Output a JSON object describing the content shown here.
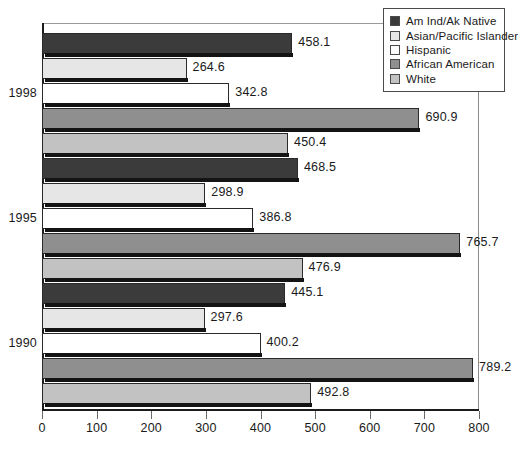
{
  "chart_data": {
    "type": "bar",
    "orientation": "horizontal",
    "title": "",
    "xlabel": "",
    "ylabel": "",
    "xlim": [
      0,
      800
    ],
    "xticks": [
      0,
      100,
      200,
      300,
      400,
      500,
      600,
      700,
      800
    ],
    "xtick_labels": [
      "0",
      "100",
      "200",
      "300",
      "400",
      "500",
      "600",
      "700",
      "800"
    ],
    "grid": false,
    "legend_position": "top-right",
    "categories": [
      "1998",
      "1995",
      "1990"
    ],
    "series": [
      {
        "name": "Am Ind/Ak Native",
        "color": "#3b3b3b",
        "values": [
          458.1,
          468.5,
          445.1
        ],
        "labels": [
          "458.1",
          "468.5",
          "445.1"
        ]
      },
      {
        "name": "Asian/Pacific Islander",
        "color": "#e6e6e6",
        "values": [
          264.6,
          298.9,
          297.6
        ],
        "labels": [
          "264.6",
          "298.9",
          "297.6"
        ]
      },
      {
        "name": "Hispanic",
        "color": "#ffffff",
        "values": [
          342.8,
          386.8,
          400.2
        ],
        "labels": [
          "342.8",
          "386.8",
          "400.2"
        ]
      },
      {
        "name": "African American",
        "color": "#8f8f8f",
        "values": [
          690.9,
          765.7,
          789.2
        ],
        "labels": [
          "690.9",
          "765.7",
          "789.2"
        ]
      },
      {
        "name": "White",
        "color": "#c2c2c2",
        "values": [
          450.4,
          476.9,
          492.8
        ],
        "labels": [
          "450.4",
          "476.9",
          "492.8"
        ]
      }
    ]
  },
  "legend": {
    "items": [
      {
        "label": "Am Ind/Ak Native",
        "color": "#3b3b3b"
      },
      {
        "label": "Asian/Pacific Islander",
        "color": "#e6e6e6"
      },
      {
        "label": "Hispanic",
        "color": "#ffffff"
      },
      {
        "label": "African American",
        "color": "#8f8f8f"
      },
      {
        "label": "White",
        "color": "#c2c2c2"
      }
    ]
  },
  "axis": {
    "x_tick_labels": [
      "0",
      "100",
      "200",
      "300",
      "400",
      "500",
      "600",
      "700",
      "800"
    ],
    "group_labels": [
      "1998",
      "1995",
      "1990"
    ]
  }
}
